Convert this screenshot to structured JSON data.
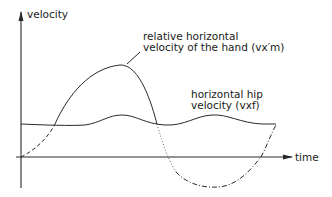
{
  "diagram": {
    "y_axis_label": "velocity",
    "x_axis_label": "time",
    "curves": [
      {
        "name": "hand",
        "label_line1": "relative horizontal",
        "label_line2": "velocity of the hand (vx′m)",
        "styles": [
          "dashed",
          "solid",
          "dotted",
          "dash-dot"
        ]
      },
      {
        "name": "hip",
        "label_line1": "horizontal hip",
        "label_line2": "velocity (vxf)",
        "styles": [
          "solid"
        ]
      }
    ],
    "line_color": "#2a2a2a"
  }
}
